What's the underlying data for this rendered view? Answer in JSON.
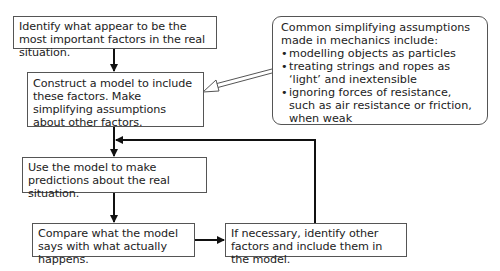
{
  "diagram": {
    "type": "flowchart",
    "boxes": {
      "identify": "Identify what appear to be the most important factors in the real situation.",
      "construct": "Construct a model to include these factors. Make simplifying assumptions about other factors.",
      "predict": "Use the model to make predictions about the real situation.",
      "compare": "Compare what the model says with what actually happens.",
      "refine": "If necessary, identify other factors and include them in the model."
    },
    "callout": {
      "intro": "Common simplifying assumptions made in mechanics include:",
      "items": [
        "modelling objects as particles",
        "treating strings and ropes as ‘light’ and inextensible",
        "ignoring forces of resistance, such as air resistance or friction, when weak"
      ]
    },
    "edges": [
      {
        "from": "identify",
        "to": "construct"
      },
      {
        "from": "construct",
        "to": "predict"
      },
      {
        "from": "predict",
        "to": "compare"
      },
      {
        "from": "compare",
        "to": "refine"
      },
      {
        "from": "refine",
        "to": "predict",
        "note": "feedback loop"
      },
      {
        "from": "callout",
        "to": "construct",
        "style": "hollow arrow"
      }
    ]
  }
}
